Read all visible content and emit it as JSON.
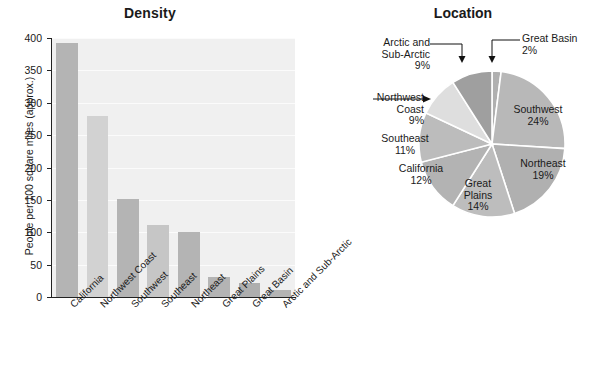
{
  "chart_data": [
    {
      "type": "bar",
      "title": "Density",
      "xlabel": "",
      "ylabel": "People per 100 square miles (approx.)",
      "ylim": [
        0,
        400
      ],
      "yticks": [
        0,
        50,
        100,
        150,
        200,
        250,
        300,
        350,
        400
      ],
      "grid": true,
      "legend": "none",
      "categories": [
        "California",
        "Northwest Coast",
        "Southwest",
        "Southeast",
        "Northeast",
        "Great Plains",
        "Great Basin",
        "Arctic and Sub-Arctic"
      ],
      "values": [
        392,
        280,
        151,
        111,
        101,
        31,
        21,
        11
      ],
      "bar_colors": [
        "#b4b4b4",
        "#d2d2d2",
        "#b4b4b4",
        "#c6c6c6",
        "#b4b4b4",
        "#b4b4b4",
        "#aeaeae",
        "#b4b4b4"
      ],
      "plot_background": "#f0f0f0"
    },
    {
      "type": "pie",
      "title": "Location",
      "start_angle_deg": 0,
      "direction": "clockwise",
      "slices": [
        {
          "label": "Great Basin",
          "value": 2,
          "display": "2%",
          "color": "#b0b0b0",
          "label_style": "callout"
        },
        {
          "label": "Southwest",
          "value": 24,
          "display": "24%",
          "color": "#b8b8b8",
          "label_style": "inside"
        },
        {
          "label": "Northeast",
          "value": 19,
          "display": "19%",
          "color": "#b0b0b0",
          "label_style": "inside"
        },
        {
          "label": "Great Plains",
          "value": 14,
          "display": "14%",
          "color": "#bdbdbd",
          "label_style": "inside"
        },
        {
          "label": "California",
          "value": 12,
          "display": "12%",
          "color": "#b3b3b3",
          "label_style": "inside"
        },
        {
          "label": "Southeast",
          "value": 11,
          "display": "11%",
          "color": "#bcbcbc",
          "label_style": "inside"
        },
        {
          "label": "Northwest Coast",
          "value": 9,
          "display": "9%",
          "color": "#dedede",
          "label_style": "callout"
        },
        {
          "label": "Arctic and Sub-Arctic",
          "value": 9,
          "display": "9%",
          "color": "#9f9f9f",
          "label_style": "callout"
        }
      ]
    }
  ],
  "bar": {
    "title": "Density",
    "ylabel": "People per 100 square miles (approx.)",
    "yticks": [
      "400",
      "350",
      "300",
      "250",
      "200",
      "150",
      "100",
      "50",
      "0"
    ],
    "categories": [
      "California",
      "Northwest Coast",
      "Southwest",
      "Southeast",
      "Northeast",
      "Great Plains",
      "Great Basin",
      "Arctic and Sub-Arctic"
    ]
  },
  "pie": {
    "title": "Location",
    "inside_labels": [
      {
        "name": "Southwest",
        "pct": "24%"
      },
      {
        "name": "Northeast",
        "pct": "19%"
      },
      {
        "name": "Great\nPlains",
        "pct": "14%"
      },
      {
        "name": "California",
        "pct": "12%"
      },
      {
        "name": "Southeast",
        "pct": "11%"
      }
    ],
    "southwest_name": "Southwest",
    "southwest_pct": "24%",
    "northeast_name": "Northeast",
    "northeast_pct": "19%",
    "greatplains_name1": "Great",
    "greatplains_name2": "Plains",
    "greatplains_pct": "14%",
    "california_name": "California",
    "california_pct": "12%",
    "southeast_name": "Southeast",
    "southeast_pct": "11%",
    "greatbasin_name": "Great Basin",
    "greatbasin_pct": "2%",
    "northwestcoast_name1": "Northwest",
    "northwestcoast_name2": "Coast",
    "northwestcoast_pct": "9%",
    "arctic_name1": "Arctic and",
    "arctic_name2": "Sub-Arctic",
    "arctic_pct": "9%"
  }
}
